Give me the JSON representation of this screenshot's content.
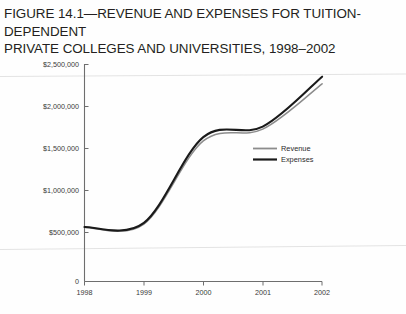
{
  "figure": {
    "title": "FIGURE 14.1—REVENUE AND EXPENSES FOR TUITION-DEPENDENT\nPRIVATE COLLEGES AND UNIVERSITIES, 1998–2002",
    "title_line_1": "FIGURE 14.1—REVENUE AND EXPENSES FOR TUITION-DEPENDENT",
    "title_line_2": "PRIVATE COLLEGES AND UNIVERSITIES, 1998–2002",
    "footer_partial": ""
  },
  "colors": {
    "revenue": "#8c8c8c",
    "expenses": "#1a1a1a",
    "axis": "#6e6e6e",
    "text": "#3a3a3a",
    "title": "#231f20",
    "background": "#ffffff"
  },
  "chart_data": {
    "type": "line",
    "title": "FIGURE 14.1—REVENUE AND EXPENSES FOR TUITION-DEPENDENT PRIVATE COLLEGES AND UNIVERSITIES, 1998–2002",
    "xlabel": "",
    "ylabel": "",
    "grid": false,
    "legend_position": "inside-right",
    "categories": [
      "1998",
      "1999",
      "2000",
      "2001",
      "2002"
    ],
    "x_tick_labels": [
      "1998",
      "1999",
      "2000",
      "2001",
      "2002"
    ],
    "y_tick_labels": [
      "0",
      "$500,000",
      "$1,000,000",
      "$1,500,000",
      "$2,000,000",
      "$2,500,000"
    ],
    "y_tick_values": [
      0,
      500000,
      1000000,
      1500000,
      2000000,
      2500000
    ],
    "ylim": [
      0,
      2500000
    ],
    "y_axis_note": "first interval 0 to $500,000 is compressed relative to upper intervals",
    "series": [
      {
        "name": "Revenue",
        "color": "#8c8c8c",
        "values": [
          560000,
          600000,
          1590000,
          1730000,
          2270000
        ]
      },
      {
        "name": "Expenses",
        "color": "#1a1a1a",
        "values": [
          565000,
          615000,
          1635000,
          1760000,
          2355000
        ]
      }
    ],
    "legend": [
      {
        "label": "Revenue",
        "color": "#8c8c8c"
      },
      {
        "label": "Expenses",
        "color": "#1a1a1a"
      }
    ],
    "annotations": []
  }
}
